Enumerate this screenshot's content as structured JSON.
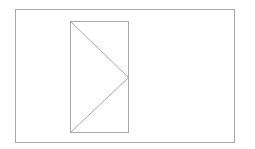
{
  "diagram": {
    "background": "#ffffff",
    "stroke_color": "#a8a8a8",
    "stroke_width": 1,
    "outer_frame": {
      "x": 15,
      "y": 9,
      "width": 219,
      "height": 133
    },
    "inner_rect": {
      "x": 70,
      "y": 21,
      "width": 58,
      "height": 111
    },
    "triangle": {
      "points": [
        [
          70,
          21
        ],
        [
          128,
          77
        ],
        [
          70,
          132
        ]
      ]
    }
  }
}
